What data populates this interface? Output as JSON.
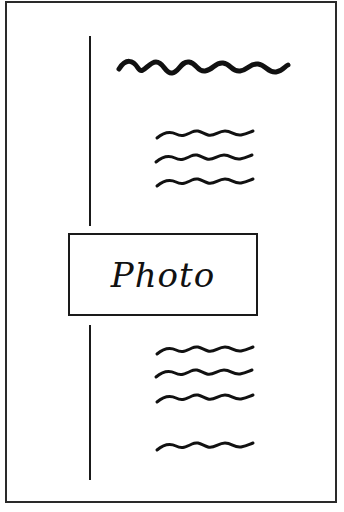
{
  "layout": {
    "title": "Page layout sketch with photo placeholder",
    "photo_box": {
      "label": "Photo"
    },
    "heading_placeholder": {
      "type": "wavy-line",
      "weight": "bold"
    },
    "text_groups": [
      {
        "position": "above-photo",
        "lines": 3
      },
      {
        "position": "below-photo",
        "lines": 4,
        "note": "last line separated by a gap"
      }
    ],
    "vertical_rule": {
      "segments": 2,
      "position": "left-margin"
    },
    "colors": {
      "ink": "#111111",
      "paper": "#ffffff",
      "border": "#2a2a2a"
    }
  }
}
